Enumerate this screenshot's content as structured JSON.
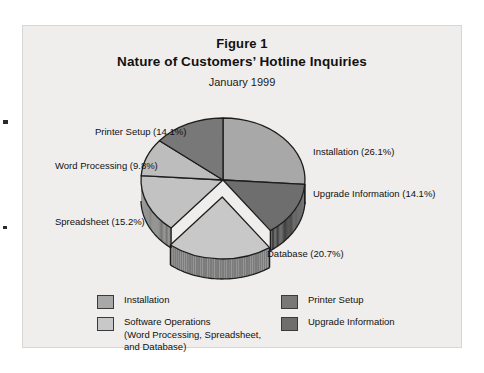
{
  "figure": {
    "number": "Figure 1",
    "title": "Nature of Customers’ Hotline Inquiries",
    "subtitle": "January 1999"
  },
  "callouts": {
    "printer_setup": "Printer Setup (14.1%)",
    "word_processing": "Word Processing (9.8%)",
    "spreadsheet": "Spreadsheet (15.2%)",
    "installation": "Installation (26.1%)",
    "upgrade_information": "Upgrade Information (14.1%)",
    "database": "Database (20.7%)"
  },
  "legend": {
    "left": [
      {
        "label": "Installation",
        "color": "#a8a8a8"
      },
      {
        "label": "Software Operations\n(Word Processing, Spreadsheet,\nand Database)",
        "color": "#c8c8c8"
      }
    ],
    "right": [
      {
        "label": "Printer Setup",
        "color": "#787878"
      },
      {
        "label": "Upgrade Information",
        "color": "#6e6e6e"
      }
    ]
  },
  "chart_data": {
    "type": "pie",
    "title": "Nature of Customers’ Hotline Inquiries",
    "subtitle": "January 1999",
    "unit": "percent",
    "exploded_slice": "Database",
    "legend_position": "bottom",
    "grid": false,
    "categories": [
      "Installation",
      "Upgrade Information",
      "Database",
      "Spreadsheet",
      "Word Processing",
      "Printer Setup"
    ],
    "values": [
      26.1,
      14.1,
      20.7,
      15.2,
      9.8,
      14.1
    ],
    "colors": [
      "#a8a8a8",
      "#6e6e6e",
      "#c8c8c8",
      "#c2c2c2",
      "#bdbdbd",
      "#787878"
    ],
    "slices": [
      {
        "name": "Installation",
        "value": 26.1,
        "color": "#a8a8a8",
        "group": "Installation"
      },
      {
        "name": "Upgrade Information",
        "value": 14.1,
        "color": "#6e6e6e",
        "group": "Upgrade Information"
      },
      {
        "name": "Database",
        "value": 20.7,
        "color": "#c8c8c8",
        "group": "Software Operations"
      },
      {
        "name": "Spreadsheet",
        "value": 15.2,
        "color": "#c2c2c2",
        "group": "Software Operations"
      },
      {
        "name": "Word Processing",
        "value": 9.8,
        "color": "#bdbdbd",
        "group": "Software Operations"
      },
      {
        "name": "Printer Setup",
        "value": 14.1,
        "color": "#787878",
        "group": "Printer Setup"
      }
    ]
  }
}
